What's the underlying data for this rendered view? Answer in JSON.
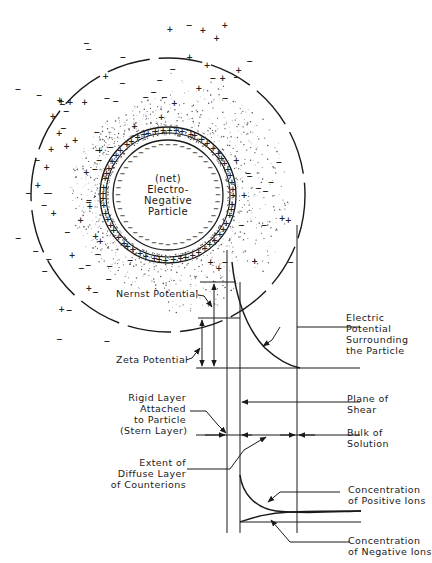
{
  "diagram": {
    "colors": {
      "ink": "#1a1a1a",
      "background": "#ffffff",
      "stipple": "#555555"
    },
    "particle_label": [
      "(net)",
      "Electro-",
      "Negative",
      "Particle"
    ],
    "labels": {
      "nernst": "Nernst Potential",
      "zeta": "Zeta Potential",
      "electric_potential": [
        "Electric",
        "Potential",
        "Surrounding",
        "the Particle"
      ],
      "plane_of_shear": [
        "Plane of",
        "Shear"
      ],
      "rigid_layer": [
        "Rigid Layer",
        "Attached",
        "to Particle",
        "(Stern Layer)"
      ],
      "bulk_of_solution": [
        "Bulk of",
        "Solution"
      ],
      "diffuse_layer": [
        "Extent of",
        "Diffuse Layer",
        "of Counterions"
      ],
      "positive_ions": [
        "Concentration",
        "of Positive Ions"
      ],
      "negative_ions": [
        "Concentration",
        "of Negative Ions"
      ]
    },
    "ion_symbols": {
      "positive": "+",
      "negative": "−"
    }
  }
}
